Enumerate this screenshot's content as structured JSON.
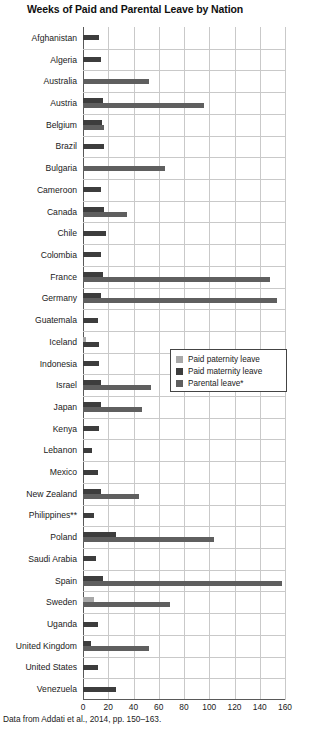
{
  "title": "Weeks of Paid and Parental Leave by Nation",
  "source_note": "Data from Addati et al., 2014, pp. 150–163.",
  "legend": {
    "position": "inside-right-middle",
    "items": [
      {
        "key": "paternity",
        "label": "Paid paternity leave",
        "color": "#a8a8a8"
      },
      {
        "key": "maternity",
        "label": "Paid maternity leave",
        "color": "#3d3d3d"
      },
      {
        "key": "parental",
        "label": "Parental leave*",
        "color": "#5f5f5f"
      }
    ]
  },
  "chart_data": {
    "type": "bar",
    "orientation": "horizontal",
    "title": "Weeks of Paid and Parental Leave by Nation",
    "xlabel": "",
    "ylabel": "",
    "xlim": [
      0,
      160
    ],
    "xticks": [
      0,
      20,
      40,
      60,
      80,
      100,
      120,
      140,
      160
    ],
    "grid": true,
    "categories": [
      "Afghanistan",
      "Algeria",
      "Australia",
      "Austria",
      "Belgium",
      "Brazil",
      "Bulgaria",
      "Cameroon",
      "Canada",
      "Chile",
      "Colombia",
      "France",
      "Germany",
      "Guatemala",
      "Iceland",
      "Indonesia",
      "Israel",
      "Japan",
      "Kenya",
      "Lebanon",
      "Mexico",
      "New Zealand",
      "Philippines**",
      "Poland",
      "Saudi Arabia",
      "Spain",
      "Sweden",
      "Uganda",
      "United Kingdom",
      "United States",
      "Venezuela"
    ],
    "series": [
      {
        "name": "Paid paternity leave",
        "key": "paternity",
        "color": "#a8a8a8",
        "values": [
          0,
          0,
          0,
          0,
          0,
          0,
          0,
          0,
          0,
          0,
          0,
          0,
          0,
          0,
          2,
          0,
          0,
          0,
          0,
          0,
          0,
          0,
          0,
          0,
          0,
          0,
          9,
          0,
          0,
          0,
          0
        ]
      },
      {
        "name": "Paid maternity leave",
        "key": "maternity",
        "color": "#3d3d3d",
        "values": [
          13,
          14,
          0,
          16,
          15,
          17,
          0,
          14,
          17,
          18,
          14,
          16,
          14,
          12,
          13,
          13,
          14,
          14,
          13,
          7,
          12,
          14,
          9,
          26,
          10,
          16,
          0,
          12,
          6,
          12,
          26
        ]
      },
      {
        "name": "Parental leave*",
        "key": "parental",
        "color": "#5f5f5f",
        "values": [
          0,
          0,
          52,
          96,
          17,
          0,
          65,
          0,
          35,
          0,
          0,
          148,
          154,
          0,
          0,
          0,
          54,
          47,
          0,
          0,
          0,
          44,
          0,
          104,
          0,
          158,
          69,
          0,
          52,
          0,
          0
        ]
      }
    ]
  }
}
